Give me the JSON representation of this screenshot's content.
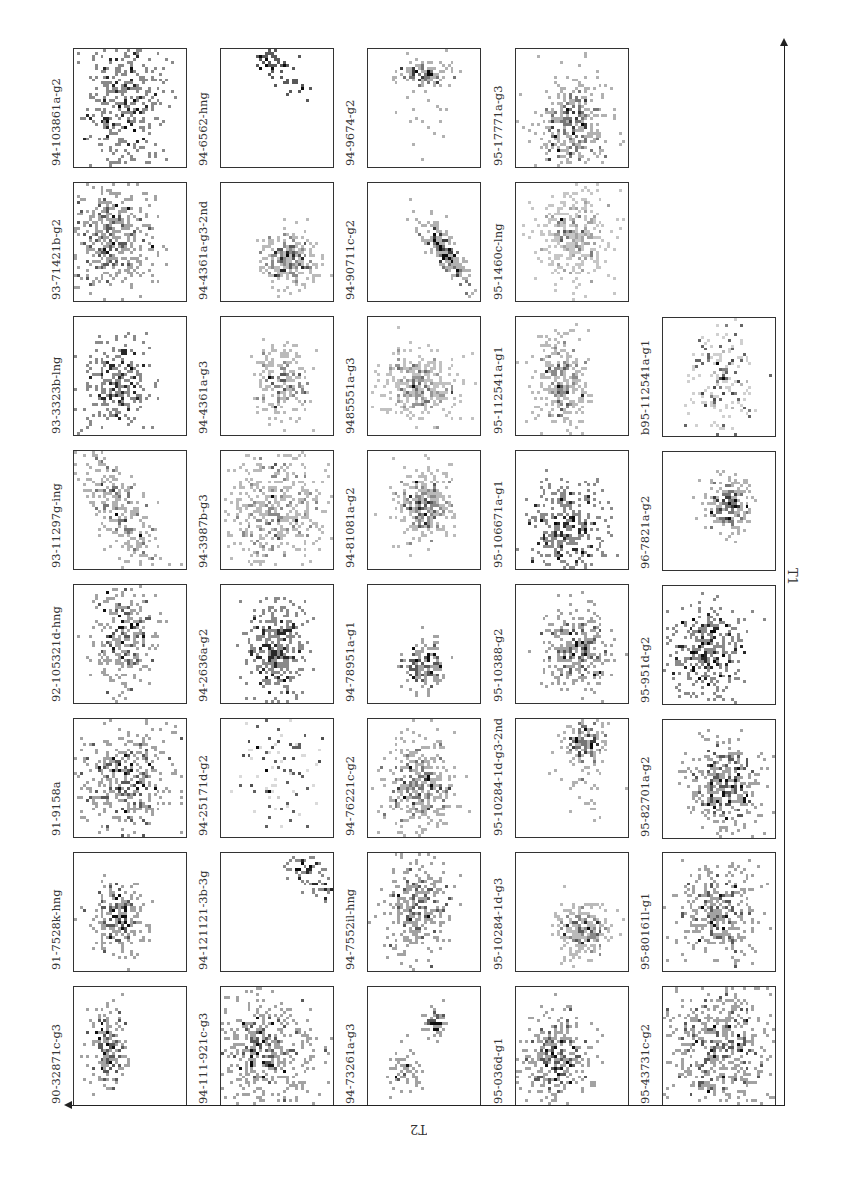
{
  "chart_data": {
    "type": "heatmap",
    "title": "",
    "xlabel": "T1",
    "ylabel": "T2",
    "grid": false,
    "layout": {
      "columns": 5,
      "rows": 8
    },
    "panels": [
      {
        "label": "94-103861a-g2",
        "col": 1,
        "row": 1,
        "cx": 0.45,
        "cy": 0.45,
        "sx": 0.2,
        "sy": 0.3,
        "n": 380,
        "shape": "broad"
      },
      {
        "label": "93-71421b-g2",
        "col": 1,
        "row": 2,
        "cx": 0.35,
        "cy": 0.45,
        "sx": 0.18,
        "sy": 0.22,
        "n": 420,
        "shape": "broad"
      },
      {
        "label": "93-3323b-lng",
        "col": 1,
        "row": 3,
        "cx": 0.38,
        "cy": 0.55,
        "sx": 0.15,
        "sy": 0.2,
        "n": 260,
        "shape": "broad"
      },
      {
        "label": "93-11297g-ing",
        "col": 1,
        "row": 4,
        "cx": 0.4,
        "cy": 0.5,
        "sx": 0.15,
        "sy": 0.22,
        "n": 300,
        "shape": "diag"
      },
      {
        "label": "92-105321d-hng",
        "col": 1,
        "row": 5,
        "cx": 0.45,
        "cy": 0.4,
        "sx": 0.14,
        "sy": 0.25,
        "n": 320,
        "shape": "broad"
      },
      {
        "label": "91-9158a",
        "col": 1,
        "row": 6,
        "cx": 0.45,
        "cy": 0.5,
        "sx": 0.2,
        "sy": 0.22,
        "n": 420,
        "shape": "broad"
      },
      {
        "label": "91-7528k-hng",
        "col": 1,
        "row": 7,
        "cx": 0.4,
        "cy": 0.55,
        "sx": 0.12,
        "sy": 0.15,
        "n": 240,
        "shape": "broad"
      },
      {
        "label": "90-32871c-g3",
        "col": 1,
        "row": 8,
        "cx": 0.3,
        "cy": 0.5,
        "sx": 0.08,
        "sy": 0.18,
        "n": 200,
        "shape": "broad"
      },
      {
        "label": "94-6562-hng",
        "col": 2,
        "row": 1,
        "cx": 0.45,
        "cy": 0.1,
        "sx": 0.1,
        "sy": 0.08,
        "n": 60,
        "shape": "corner"
      },
      {
        "label": "94-4361a-g3-2nd",
        "col": 2,
        "row": 2,
        "cx": 0.6,
        "cy": 0.65,
        "sx": 0.12,
        "sy": 0.12,
        "n": 280,
        "shape": "broad"
      },
      {
        "label": "94-4361a-g3",
        "col": 2,
        "row": 3,
        "cx": 0.55,
        "cy": 0.55,
        "sx": 0.12,
        "sy": 0.18,
        "n": 220,
        "shape": "broad"
      },
      {
        "label": "94-3987b-g3",
        "col": 2,
        "row": 4,
        "cx": 0.5,
        "cy": 0.5,
        "sx": 0.22,
        "sy": 0.26,
        "n": 460,
        "shape": "broad"
      },
      {
        "label": "94-2636a-g2",
        "col": 2,
        "row": 5,
        "cx": 0.5,
        "cy": 0.55,
        "sx": 0.13,
        "sy": 0.22,
        "n": 320,
        "shape": "broad"
      },
      {
        "label": "94-25171d-g2",
        "col": 2,
        "row": 6,
        "cx": 0.5,
        "cy": 0.45,
        "sx": 0.25,
        "sy": 0.28,
        "n": 500,
        "shape": "broad"
      },
      {
        "label": "94-121121-3b-3g",
        "col": 2,
        "row": 7,
        "cx": 0.75,
        "cy": 0.12,
        "sx": 0.08,
        "sy": 0.06,
        "n": 80,
        "shape": "corner"
      },
      {
        "label": "94-111-921c-g3",
        "col": 2,
        "row": 8,
        "cx": 0.4,
        "cy": 0.55,
        "sx": 0.22,
        "sy": 0.25,
        "n": 460,
        "shape": "broad"
      },
      {
        "label": "94-9674-g2",
        "col": 3,
        "row": 1,
        "cx": 0.5,
        "cy": 0.2,
        "sx": 0.12,
        "sy": 0.06,
        "n": 140,
        "shape": "top"
      },
      {
        "label": "94-90711c-g2",
        "col": 3,
        "row": 2,
        "cx": 0.7,
        "cy": 0.6,
        "sx": 0.08,
        "sy": 0.1,
        "n": 220,
        "shape": "diag"
      },
      {
        "label": "9485551a-g3",
        "col": 3,
        "row": 3,
        "cx": 0.45,
        "cy": 0.6,
        "sx": 0.18,
        "sy": 0.15,
        "n": 340,
        "shape": "broad"
      },
      {
        "label": "94-81081a-g2",
        "col": 3,
        "row": 4,
        "cx": 0.5,
        "cy": 0.45,
        "sx": 0.12,
        "sy": 0.15,
        "n": 320,
        "shape": "broad"
      },
      {
        "label": "94-78951a-g1",
        "col": 3,
        "row": 5,
        "cx": 0.5,
        "cy": 0.7,
        "sx": 0.1,
        "sy": 0.1,
        "n": 160,
        "shape": "broad"
      },
      {
        "label": "94-76221c-g2",
        "col": 3,
        "row": 6,
        "cx": 0.45,
        "cy": 0.55,
        "sx": 0.15,
        "sy": 0.2,
        "n": 380,
        "shape": "broad"
      },
      {
        "label": "94-7552il-hng",
        "col": 3,
        "row": 7,
        "cx": 0.45,
        "cy": 0.45,
        "sx": 0.15,
        "sy": 0.22,
        "n": 300,
        "shape": "broad"
      },
      {
        "label": "94-73261a-g3",
        "col": 3,
        "row": 8,
        "cx": 0.6,
        "cy": 0.3,
        "sx": 0.06,
        "sy": 0.06,
        "n": 120,
        "shape": "bimodal"
      },
      {
        "label": "95-17771a-g3",
        "col": 4,
        "row": 1,
        "cx": 0.5,
        "cy": 0.65,
        "sx": 0.16,
        "sy": 0.2,
        "n": 380,
        "shape": "broad"
      },
      {
        "label": "95-1460c-lng",
        "col": 4,
        "row": 2,
        "cx": 0.5,
        "cy": 0.45,
        "sx": 0.17,
        "sy": 0.2,
        "n": 360,
        "shape": "broad"
      },
      {
        "label": "95-112541a-g1",
        "col": 4,
        "row": 3,
        "cx": 0.4,
        "cy": 0.55,
        "sx": 0.12,
        "sy": 0.2,
        "n": 300,
        "shape": "broad"
      },
      {
        "label": "95-106671a-g1",
        "col": 4,
        "row": 4,
        "cx": 0.45,
        "cy": 0.65,
        "sx": 0.17,
        "sy": 0.2,
        "n": 320,
        "shape": "broad"
      },
      {
        "label": "95-10388-g2",
        "col": 4,
        "row": 5,
        "cx": 0.55,
        "cy": 0.55,
        "sx": 0.15,
        "sy": 0.17,
        "n": 300,
        "shape": "broad"
      },
      {
        "label": "95-10284-1d-g3-2nd",
        "col": 4,
        "row": 6,
        "cx": 0.6,
        "cy": 0.2,
        "sx": 0.1,
        "sy": 0.1,
        "n": 200,
        "shape": "top"
      },
      {
        "label": "95-10284-1d-g3",
        "col": 4,
        "row": 7,
        "cx": 0.6,
        "cy": 0.65,
        "sx": 0.12,
        "sy": 0.12,
        "n": 240,
        "shape": "broad"
      },
      {
        "label": "95-036d-g1",
        "col": 4,
        "row": 8,
        "cx": 0.35,
        "cy": 0.6,
        "sx": 0.15,
        "sy": 0.18,
        "n": 340,
        "shape": "broad"
      },
      {
        "label": "b95-112541a-g1",
        "col": 5,
        "row": 4,
        "cx": 0.55,
        "cy": 0.5,
        "sx": 0.15,
        "sy": 0.25,
        "n": 380,
        "shape": "broad"
      },
      {
        "label": "96-7821a-g2",
        "col": 5,
        "row": 5,
        "cx": 0.6,
        "cy": 0.45,
        "sx": 0.1,
        "sy": 0.12,
        "n": 220,
        "shape": "broad"
      },
      {
        "label": "95-951d-g2",
        "col": 5,
        "row": 6,
        "cx": 0.4,
        "cy": 0.55,
        "sx": 0.17,
        "sy": 0.2,
        "n": 340,
        "shape": "broad"
      },
      {
        "label": "95-82701a-g2",
        "col": 5,
        "row": 7,
        "cx": 0.55,
        "cy": 0.55,
        "sx": 0.17,
        "sy": 0.2,
        "n": 380,
        "shape": "broad"
      },
      {
        "label": "95-80161l-g1",
        "col": 5,
        "row": 8,
        "cx": 0.5,
        "cy": 0.5,
        "sx": 0.18,
        "sy": 0.2,
        "n": 340,
        "shape": "broad"
      },
      {
        "label": "95-43731c-g2",
        "col": 5,
        "row": 9,
        "cx": 0.5,
        "cy": 0.5,
        "sx": 0.25,
        "sy": 0.28,
        "n": 560,
        "shape": "broad"
      }
    ]
  },
  "axes": {
    "t1_label": "T1",
    "t2_label": "T2"
  }
}
